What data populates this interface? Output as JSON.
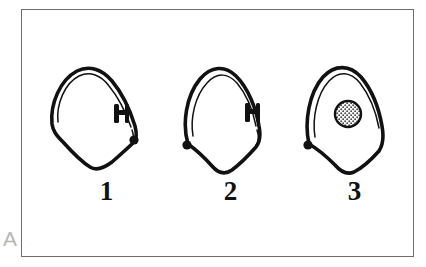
{
  "panel": {
    "label": "A",
    "label_color": "#b6b6b6",
    "border_color": "#6d6d6d",
    "background": "#ffffff"
  },
  "ink_color": "#111111",
  "figures": [
    {
      "caption": "1",
      "name": "tooth-outline-figure-1",
      "description": "hand-drawn tooth outline with double contour line, a small dark bar-shaped marker on the inner right wall and a filled round dot at the lower right of the crown",
      "markers": [
        {
          "type": "bar-marker",
          "side": "right",
          "x": 74,
          "y": 61
        },
        {
          "type": "dot-marker",
          "side": "right",
          "x": 90,
          "y": 88
        }
      ],
      "lesion": null
    },
    {
      "caption": "2",
      "name": "tooth-outline-figure-2",
      "description": "hand-drawn tooth outline with double contour line, a small dark bar-shaped marker on the inner right wall and a filled round dot at the lower left",
      "markers": [
        {
          "type": "bar-marker",
          "side": "right",
          "x": 81,
          "y": 60
        },
        {
          "type": "dot-marker",
          "side": "left",
          "x": 19,
          "y": 93
        }
      ],
      "lesion": null
    },
    {
      "caption": "3",
      "name": "tooth-outline-figure-3",
      "description": "hand-drawn tooth outline with double contour line, a filled round dot at the lower left and a stippled/hatched round lesion inside the crown",
      "markers": [
        {
          "type": "dot-marker",
          "side": "left",
          "x": 16,
          "y": 93
        }
      ],
      "lesion": {
        "type": "stippled-circle",
        "cx": 56,
        "cy": 62,
        "r": 13,
        "fill_pattern": "dots",
        "outline_color": "#111111"
      }
    }
  ]
}
